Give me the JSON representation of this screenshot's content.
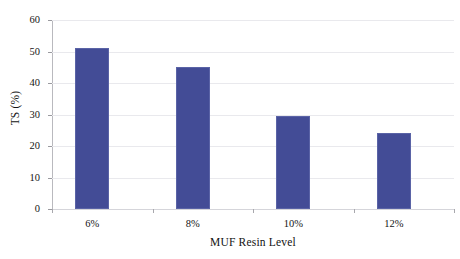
{
  "chart_data": {
    "type": "bar",
    "title": "",
    "categories": [
      "6%",
      "8%",
      "10%",
      "12%"
    ],
    "values": [
      51,
      45,
      29.5,
      24
    ],
    "series": [
      {
        "name": "TS (%)",
        "values": [
          51,
          45,
          29.5,
          24
        ]
      }
    ],
    "xlabel": "MUF Resin Level",
    "ylabel": "TS (%)",
    "ylim": [
      0,
      60
    ],
    "yticks": [
      0,
      10,
      20,
      30,
      40,
      50,
      60
    ],
    "ytick_labels": [
      "0",
      "10",
      "20",
      "30",
      "40",
      "50",
      "60"
    ],
    "grid": "horizontal",
    "legend": "none",
    "bar_color": "#434C96",
    "bar_edge_color": "#5A63A6",
    "gridline_color": "#E9E9ED",
    "axis_color": "#B9B9BE",
    "background_color": "#FFFFFF"
  },
  "axes": {
    "y_title": "TS (%)",
    "x_title": "MUF Resin Level"
  }
}
